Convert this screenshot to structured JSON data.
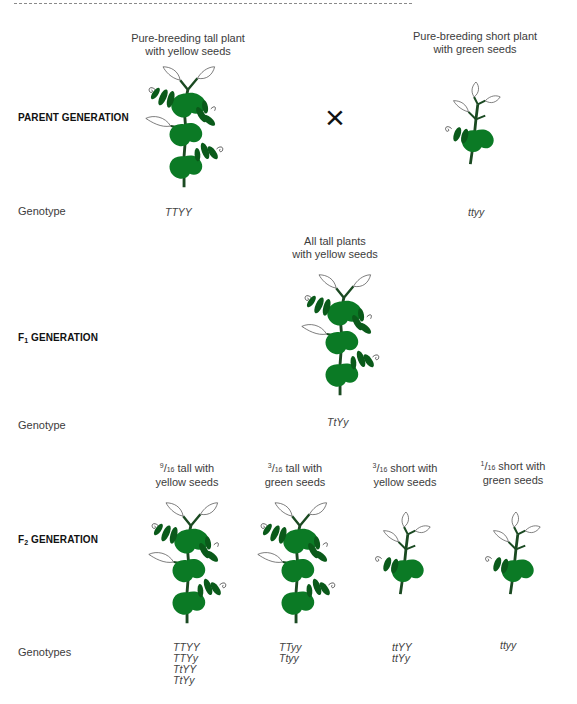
{
  "colors": {
    "leaf_light": "#0b7a25",
    "leaf_dark": "#0a5a1a",
    "stem": "#1b4a22",
    "outline_leaf": "#555555",
    "text": "#3c3c3c",
    "heading": "#111111"
  },
  "parent": {
    "label": "PARENT GENERATION",
    "genotype_label": "Genotype",
    "left": {
      "caption_line1": "Pure-breeding tall plant",
      "caption_line2": "with yellow seeds",
      "plant_type": "tall",
      "genotype": "TTYY"
    },
    "cross_symbol": "×",
    "right": {
      "caption_line1": "Pure-breeding short plant",
      "caption_line2": "with green seeds",
      "plant_type": "short",
      "genotype": "ttyy"
    }
  },
  "f1": {
    "label_prefix": "F",
    "label_sub": "1",
    "label_suffix": " GENERATION",
    "genotype_label": "Genotype",
    "caption_line1": "All tall plants",
    "caption_line2": "with yellow seeds",
    "plant_type": "tall",
    "genotype": "TtYy"
  },
  "f2": {
    "label_prefix": "F",
    "label_sub": "2",
    "label_suffix": " GENERATION",
    "genotype_label": "Genotypes",
    "groups": [
      {
        "fraction_num": "9",
        "fraction_den": "16",
        "caption_line1": " tall with",
        "caption_line2": "yellow seeds",
        "plant_type": "tall",
        "genotypes": [
          "TTYY",
          "TTYy",
          "TtYY",
          "TtYy"
        ]
      },
      {
        "fraction_num": "3",
        "fraction_den": "16",
        "caption_line1": " tall with",
        "caption_line2": "green seeds",
        "plant_type": "tall",
        "genotypes": [
          "TTyy",
          "Ttyy"
        ]
      },
      {
        "fraction_num": "3",
        "fraction_den": "16",
        "caption_line1": " short with",
        "caption_line2": "yellow seeds",
        "plant_type": "short",
        "genotypes": [
          "ttYY",
          "ttYy"
        ]
      },
      {
        "fraction_num": "1",
        "fraction_den": "16",
        "caption_line1": " short with",
        "caption_line2": "green seeds",
        "plant_type": "short",
        "genotypes": [
          "ttyy"
        ]
      }
    ]
  }
}
